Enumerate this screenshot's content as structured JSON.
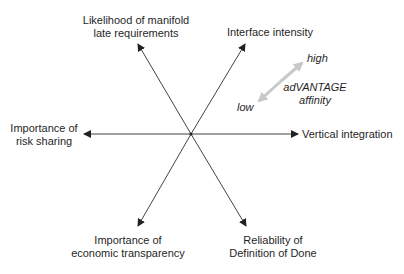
{
  "diagram": {
    "type": "radial-axes",
    "center": {
      "x": 191,
      "y": 134
    },
    "axes": [
      {
        "id": "top-left",
        "label_lines": [
          "Likelihood of manifold",
          "late requirements"
        ]
      },
      {
        "id": "top-right",
        "label_lines": [
          "Interface intensity"
        ]
      },
      {
        "id": "right",
        "label_lines": [
          "Vertical integration"
        ]
      },
      {
        "id": "bottom-right",
        "label_lines": [
          "Reliability of",
          "Definition of Done"
        ]
      },
      {
        "id": "bottom-left",
        "label_lines": [
          "Importance of",
          "economic transparency"
        ]
      },
      {
        "id": "left",
        "label_lines": [
          "Importance of",
          "risk sharing"
        ]
      }
    ],
    "legend": {
      "high_label": "high",
      "low_label": "low",
      "title_lines": [
        "adVANTAGE",
        "affinity"
      ],
      "arrow_color": "#c8c8c8"
    },
    "axis_color": "#333333"
  }
}
